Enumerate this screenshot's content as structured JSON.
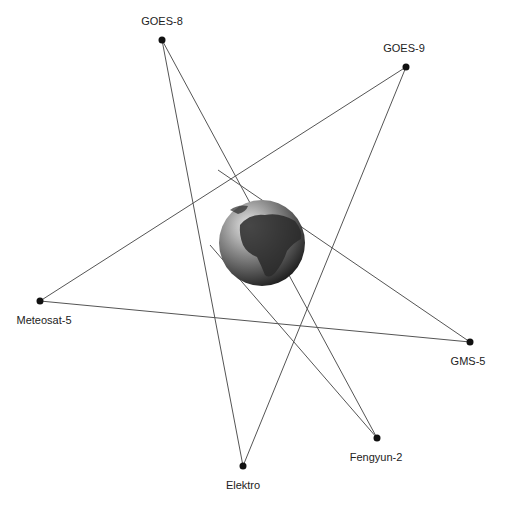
{
  "diagram": {
    "center": {
      "name": "Earth",
      "x": 262,
      "y": 243,
      "r": 43
    },
    "nodes": [
      {
        "id": "goes8",
        "label": "GOES-8",
        "x": 162,
        "y": 40,
        "lx": 162,
        "ly": 15
      },
      {
        "id": "goes9",
        "label": "GOES-9",
        "x": 406,
        "y": 67,
        "lx": 404,
        "ly": 42
      },
      {
        "id": "meteosat5",
        "label": "Meteosat-5",
        "x": 40,
        "y": 301,
        "lx": 44,
        "ly": 314
      },
      {
        "id": "gms5",
        "label": "GMS-5",
        "x": 470,
        "y": 342,
        "lx": 468,
        "ly": 355
      },
      {
        "id": "fengyun2",
        "label": "Fengyun-2",
        "x": 377,
        "y": 438,
        "lx": 376,
        "ly": 451
      },
      {
        "id": "elektro",
        "label": "Elektro",
        "x": 243,
        "y": 466,
        "lx": 243,
        "ly": 479
      }
    ],
    "edges": [
      {
        "from": [
          162,
          40
        ],
        "to": [
          243,
          466
        ]
      },
      {
        "from": [
          162,
          40
        ],
        "to": [
          377,
          438
        ]
      },
      {
        "from": [
          406,
          67
        ],
        "to": [
          40,
          301
        ]
      },
      {
        "from": [
          406,
          67
        ],
        "to": [
          243,
          466
        ]
      },
      {
        "from": [
          40,
          301
        ],
        "to": [
          470,
          342
        ]
      },
      {
        "from": [
          470,
          342
        ],
        "to": [
          218,
          170
        ]
      },
      {
        "from": [
          377,
          438
        ],
        "to": [
          210,
          245
        ]
      }
    ],
    "colors": {
      "line": "#555555",
      "node": "#111111",
      "label": "#222222"
    }
  }
}
